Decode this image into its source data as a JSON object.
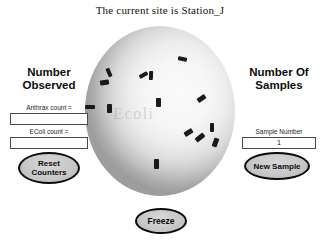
{
  "window": {
    "title": "The current site is Station_J"
  },
  "scope": {
    "name": "microscope-view",
    "watermark": "Ecoli",
    "background_light": "#fafafa",
    "background_dark": "#9d9d9d",
    "specimen_color": "#1a1a1a",
    "specimen_count": 14,
    "specimens": [
      {
        "x": 54,
        "y": 47,
        "w": 9,
        "h": 4,
        "rot": -28
      },
      {
        "x": 93,
        "y": 31,
        "w": 9,
        "h": 4,
        "rot": 12
      },
      {
        "x": 22,
        "y": 42,
        "w": 4,
        "h": 9,
        "rot": -24
      },
      {
        "x": 15,
        "y": 54,
        "w": 9,
        "h": 5,
        "rot": -8
      },
      {
        "x": -2,
        "y": 79,
        "w": 12,
        "h": 4,
        "rot": 0
      },
      {
        "x": 64,
        "y": 45,
        "w": 4,
        "h": 9,
        "rot": 2
      },
      {
        "x": 22,
        "y": 78,
        "w": 5,
        "h": 9,
        "rot": 0
      },
      {
        "x": 71,
        "y": 72,
        "w": 5,
        "h": 9,
        "rot": 0
      },
      {
        "x": 112,
        "y": 70,
        "w": 9,
        "h": 5,
        "rot": -34
      },
      {
        "x": 99,
        "y": 104,
        "w": 9,
        "h": 5,
        "rot": -32
      },
      {
        "x": 125,
        "y": 97,
        "w": 4,
        "h": 9,
        "rot": 0
      },
      {
        "x": 110,
        "y": 109,
        "w": 10,
        "h": 5,
        "rot": -38
      },
      {
        "x": 128,
        "y": 112,
        "w": 5,
        "h": 9,
        "rot": 20
      },
      {
        "x": 69,
        "y": 133,
        "w": 5,
        "h": 10,
        "rot": 0
      }
    ]
  },
  "left_panel": {
    "heading_line1": "Number",
    "heading_line2": "Observed",
    "anthrax": {
      "label": "Anthrax count =",
      "value": "",
      "placeholder": ""
    },
    "ecoli": {
      "label": "EColi count =",
      "value": "",
      "placeholder": ""
    },
    "reset_button": {
      "line1": "Reset",
      "line2": "Counters"
    }
  },
  "right_panel": {
    "heading_line1": "Number Of",
    "heading_line2": "Samples",
    "sample_number": {
      "label": "Sample Number",
      "value": "1",
      "placeholder": ""
    },
    "new_sample_button": {
      "label": "New Sample"
    }
  },
  "freeze_button": {
    "label": "Freeze"
  }
}
